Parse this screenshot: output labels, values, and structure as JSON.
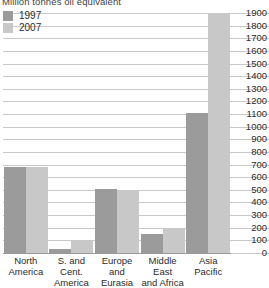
{
  "chart": {
    "title": "Million tonnes oil equivalent"
  },
  "legend": {
    "position": "top-left",
    "items": [
      {
        "label": "1997",
        "color": "#9b9b9b"
      },
      {
        "label": "2007",
        "color": "#c8c8c8"
      }
    ]
  },
  "axes": {
    "y_ticks": [
      "1900",
      "1800",
      "1700",
      "1600",
      "1500",
      "1400",
      "1300",
      "1200",
      "1100",
      "1000",
      "900",
      "800",
      "700",
      "600",
      "500",
      "400",
      "300",
      "200",
      "100",
      "0"
    ],
    "x_labels": [
      {
        "line1": "North",
        "line2": "America",
        "line3": ""
      },
      {
        "line1": "S. and Cent.",
        "line2": "America",
        "line3": ""
      },
      {
        "line1": "Europe",
        "line2": "and",
        "line3": "Eurasia"
      },
      {
        "line1": "Middle East",
        "line2": "and Africa",
        "line3": ""
      },
      {
        "line1": "Asia",
        "line2": "Pacific",
        "line3": ""
      }
    ]
  },
  "chart_data": {
    "type": "bar",
    "title": "Million tonnes oil equivalent",
    "xlabel": "",
    "ylabel": "Million tonnes oil equivalent",
    "ylim": [
      0,
      1900
    ],
    "ytick_step": 100,
    "grid": true,
    "legend_position": "top-left",
    "categories": [
      "North America",
      "S. and Cent. America",
      "Europe and Eurasia",
      "Middle East and Africa",
      "Asia Pacific"
    ],
    "series": [
      {
        "name": "1997",
        "color": "#9b9b9b",
        "values": [
          680,
          30,
          510,
          150,
          1105
        ]
      },
      {
        "name": "2007",
        "color": "#c8c8c8",
        "values": [
          680,
          105,
          490,
          195,
          1890
        ]
      }
    ]
  }
}
